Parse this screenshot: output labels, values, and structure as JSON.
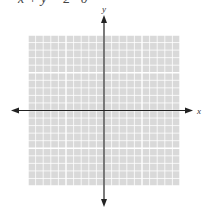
{
  "equation_partial": "x + y = 2 · 0",
  "grid": {
    "cells_x": 20,
    "cells_y": 20,
    "origin_col": 10,
    "origin_row": 10
  },
  "axes": {
    "x_label": "x",
    "y_label": "y"
  },
  "colors": {
    "grid_fill": "#d9d9d9",
    "grid_line": "#ffffff",
    "axis": "#222222"
  }
}
